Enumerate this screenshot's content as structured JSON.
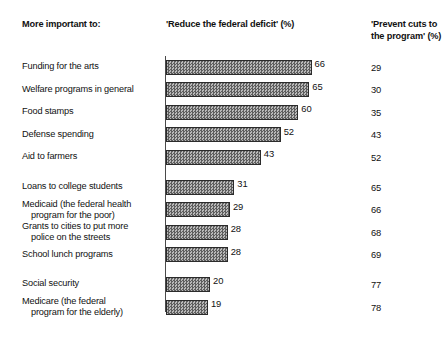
{
  "header": {
    "left_label": "More important to:",
    "mid_label": "'Reduce the federal deficit' (%)",
    "right_label": "'Prevent cuts to the program' (%)"
  },
  "chart_data": {
    "type": "bar",
    "title": "More important to:",
    "xlabel": "",
    "ylabel": "",
    "xlim": [
      0,
      100
    ],
    "grid": false,
    "orientation": "horizontal",
    "legend": "none",
    "categories": [
      "Funding for the arts",
      "Welfare programs in general",
      "Food stamps",
      "Defense spending",
      "Aid to farmers",
      "Loans to college students",
      "Medicaid (the federal health program for the poor)",
      "Grants to cities to put more police on the streets",
      "School lunch programs",
      "Social security",
      "Medicare (the federal program for the elderly)"
    ],
    "series": [
      {
        "name": "'Reduce the federal deficit' (%)",
        "values": [
          66,
          65,
          60,
          52,
          43,
          31,
          29,
          28,
          28,
          20,
          19
        ]
      },
      {
        "name": "'Prevent cuts to the program' (%)",
        "values": [
          29,
          30,
          35,
          43,
          52,
          65,
          66,
          68,
          69,
          77,
          78
        ]
      }
    ],
    "group_breaks_after": [
      4,
      8
    ]
  },
  "rows": [
    {
      "label_line1": "Funding for the arts",
      "label_line2": "",
      "bar": 66,
      "right": 29,
      "gap_after": false
    },
    {
      "label_line1": "Welfare programs in general",
      "label_line2": "",
      "bar": 65,
      "right": 30,
      "gap_after": false
    },
    {
      "label_line1": "Food stamps",
      "label_line2": "",
      "bar": 60,
      "right": 35,
      "gap_after": false
    },
    {
      "label_line1": "Defense spending",
      "label_line2": "",
      "bar": 52,
      "right": 43,
      "gap_after": false
    },
    {
      "label_line1": "Aid to farmers",
      "label_line2": "",
      "bar": 43,
      "right": 52,
      "gap_after": true
    },
    {
      "label_line1": "Loans to college students",
      "label_line2": "",
      "bar": 31,
      "right": 65,
      "gap_after": false
    },
    {
      "label_line1": "Medicaid (the federal health",
      "label_line2": "program for the poor)",
      "bar": 29,
      "right": 66,
      "gap_after": false
    },
    {
      "label_line1": "Grants to cities to put more",
      "label_line2": "police on the streets",
      "bar": 28,
      "right": 68,
      "gap_after": false
    },
    {
      "label_line1": "School lunch programs",
      "label_line2": "",
      "bar": 28,
      "right": 69,
      "gap_after": true
    },
    {
      "label_line1": "Social security",
      "label_line2": "",
      "bar": 20,
      "right": 77,
      "gap_after": false
    },
    {
      "label_line1": "Medicare (the federal",
      "label_line2": "program for the elderly)",
      "bar": 19,
      "right": 78,
      "gap_after": false
    }
  ],
  "colors": {
    "bar_fill_dark": "#5e5e5e",
    "bar_fill_light": "#b9b9b9",
    "bar_border": "#2b2b2b",
    "axis": "#4a4a4a",
    "text": "#111111",
    "background": "#ffffff"
  }
}
